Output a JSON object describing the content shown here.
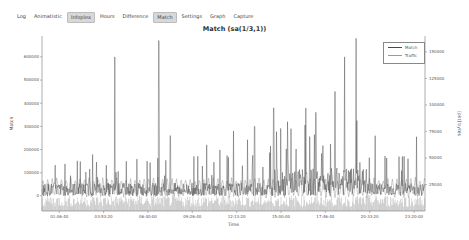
{
  "tabs": [
    {
      "label": "Log",
      "active": false
    },
    {
      "label": "Animatistic",
      "active": false
    },
    {
      "label": "Infoplex",
      "active": true
    },
    {
      "label": "Hours",
      "active": false
    },
    {
      "label": "Difference",
      "active": false
    },
    {
      "label": "Match",
      "active": true
    },
    {
      "label": "Settings",
      "active": false
    },
    {
      "label": "Graph",
      "active": false
    },
    {
      "label": "Capture",
      "active": false
    }
  ],
  "colors": {
    "match": "#4a4a4a",
    "traffic": "#9a9a9a",
    "axis": "#777777"
  },
  "chart_data": {
    "type": "line",
    "title": "Match (sa(1/3,1))",
    "xlabel": "Time",
    "ylabel": "Match",
    "y2label": "[pkt] bytes",
    "x_ticks": [
      "01:06:40",
      "03:53:20",
      "06:40:00",
      "09:26:40",
      "12:13:20",
      "15:00:00",
      "17:46:40",
      "20:33:20",
      "23:20:00"
    ],
    "y_ticks": [
      0,
      100000,
      200000,
      300000,
      400000,
      500000,
      600000
    ],
    "ylim": [
      -65000,
      690000
    ],
    "y2_ticks": [
      25000,
      50000,
      75000,
      100000,
      125000,
      150000
    ],
    "y2lim": [
      0,
      165000
    ],
    "legend": [
      "Match",
      "Traffic"
    ],
    "legend_position": "upper right",
    "grid": false,
    "series": [
      {
        "name": "Match",
        "axis": "left",
        "baseline": 40000,
        "spikes": [
          {
            "x": 0.19,
            "y": 600000
          },
          {
            "x": 0.305,
            "y": 670000
          },
          {
            "x": 0.335,
            "y": 260000
          },
          {
            "x": 0.43,
            "y": 220000
          },
          {
            "x": 0.5,
            "y": 280000
          },
          {
            "x": 0.555,
            "y": 300000
          },
          {
            "x": 0.605,
            "y": 380000
          },
          {
            "x": 0.65,
            "y": 290000
          },
          {
            "x": 0.715,
            "y": 360000
          },
          {
            "x": 0.765,
            "y": 450000
          },
          {
            "x": 0.79,
            "y": 600000
          },
          {
            "x": 0.82,
            "y": 680000
          },
          {
            "x": 0.87,
            "y": 260000
          }
        ]
      },
      {
        "name": "Traffic",
        "axis": "right",
        "baseline": 22000,
        "amplitude": 10000,
        "period_fraction": 0.012
      }
    ]
  }
}
